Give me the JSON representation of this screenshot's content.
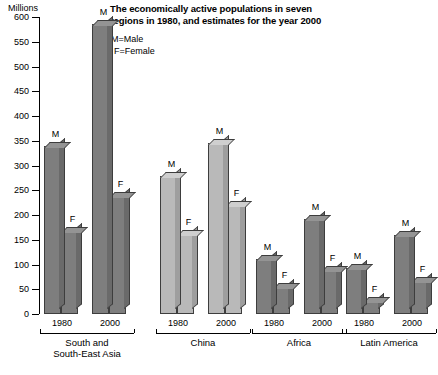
{
  "chart": {
    "type": "bar",
    "title": "The economically active populations in seven regions in 1980, and estimates for the year 2000",
    "title_line1": "The economically active populations in seven",
    "title_line2": "regions in 1980, and estimates for the year 2000",
    "axis_unit": "Millions",
    "ylabel": "Millions",
    "xlabel": "",
    "legend": [
      {
        "key": "M",
        "text": "M=Male"
      },
      {
        "key": "F",
        "text": "F=Female"
      }
    ],
    "y_ticks": [
      0,
      50,
      100,
      150,
      200,
      250,
      300,
      350,
      400,
      450,
      500,
      550,
      600
    ],
    "ylim": [
      0,
      600
    ],
    "grid": false,
    "colors": {
      "dark_gray": "#7e7e7e",
      "light_gray": "#b9b9b9",
      "outline": "#3d3d3d",
      "background": "#ffffff",
      "text": "#000000"
    }
  },
  "chart_data": {
    "type": "bar",
    "title": "The economically active populations in seven regions in 1980, and estimates for the year 2000",
    "xlabel": "",
    "ylabel": "Millions",
    "ylim": [
      0,
      600
    ],
    "yticks": [
      0,
      50,
      100,
      150,
      200,
      250,
      300,
      350,
      400,
      450,
      500,
      550,
      600
    ],
    "grid": false,
    "legend": [
      "M=Male",
      "F=Female"
    ],
    "legend_position": "top-left-inside",
    "categories": [
      "South and South-East Asia",
      "China",
      "Africa",
      "Latin America"
    ],
    "years": [
      "1980",
      "2000"
    ],
    "series": [
      {
        "name": "M",
        "values_1980": [
          340,
          278,
          112,
          92
        ],
        "values_2000": [
          585,
          345,
          192,
          160
        ]
      },
      {
        "name": "F",
        "values_1980": [
          168,
          162,
          55,
          26
        ],
        "values_2000": [
          238,
          220,
          88,
          66
        ]
      }
    ],
    "groups": [
      {
        "label": "South and South-East Asia",
        "label_line1": "South and",
        "label_line2": "South-East Asia",
        "shade": "dark",
        "subgroups": [
          {
            "year": "1980",
            "bars": [
              {
                "label": "M",
                "value": 340
              },
              {
                "label": "F",
                "value": 168
              }
            ]
          },
          {
            "year": "2000",
            "bars": [
              {
                "label": "M",
                "value": 585
              },
              {
                "label": "F",
                "value": 238
              }
            ]
          }
        ]
      },
      {
        "label": "China",
        "label_line1": "China",
        "label_line2": "",
        "shade": "light",
        "subgroups": [
          {
            "year": "1980",
            "bars": [
              {
                "label": "M",
                "value": 278
              },
              {
                "label": "F",
                "value": 162
              }
            ]
          },
          {
            "year": "2000",
            "bars": [
              {
                "label": "M",
                "value": 345
              },
              {
                "label": "F",
                "value": 220
              }
            ]
          }
        ]
      },
      {
        "label": "Africa",
        "label_line1": "Africa",
        "label_line2": "",
        "shade": "dark",
        "subgroups": [
          {
            "year": "1980",
            "bars": [
              {
                "label": "M",
                "value": 112
              },
              {
                "label": "F",
                "value": 55
              }
            ]
          },
          {
            "year": "2000",
            "bars": [
              {
                "label": "M",
                "value": 192
              },
              {
                "label": "F",
                "value": 88
              }
            ]
          }
        ]
      },
      {
        "label": "Latin America",
        "label_line1": "Latin America",
        "label_line2": "",
        "shade": "dark",
        "subgroups": [
          {
            "year": "1980",
            "bars": [
              {
                "label": "M",
                "value": 92
              },
              {
                "label": "F",
                "value": 26
              }
            ]
          },
          {
            "year": "2000",
            "bars": [
              {
                "label": "M",
                "value": 160
              },
              {
                "label": "F",
                "value": 66
              }
            ]
          }
        ]
      }
    ]
  }
}
